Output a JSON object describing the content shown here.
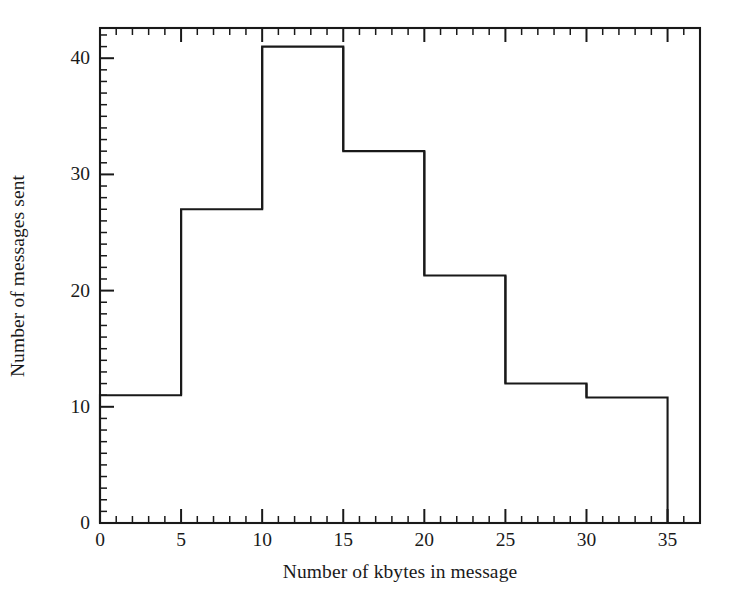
{
  "chart_data": {
    "type": "bar",
    "title": "",
    "subtitle": "",
    "xlabel": "Number of kbytes in message",
    "ylabel": "Number of messages sent",
    "bin_width": 5,
    "bin_edges": [
      0,
      5,
      10,
      15,
      20,
      25,
      30,
      35
    ],
    "categories": [
      "0-5",
      "5-10",
      "10-15",
      "15-20",
      "20-25",
      "25-30",
      "30-35"
    ],
    "values": [
      11,
      27,
      41,
      32,
      21.3,
      12,
      10.8
    ],
    "xlim": [
      0,
      37
    ],
    "ylim": [
      0,
      42.6
    ],
    "xticks": [
      0,
      5,
      10,
      15,
      20,
      25,
      30,
      35
    ],
    "xtick_labels": [
      "0",
      "5",
      "10",
      "15",
      "20",
      "25",
      "30",
      "35"
    ],
    "yticks": [
      0,
      10,
      20,
      30,
      40
    ],
    "ytick_labels": [
      "0",
      "10",
      "20",
      "30",
      "40"
    ],
    "x_minor_tick_step": 1,
    "y_minor_tick_step": 1,
    "grid": false,
    "legend": false,
    "legend_position": "none",
    "line_color": "#191919",
    "fill_color": "none",
    "background_color": "#ffffff",
    "frame": "box"
  },
  "axes": {
    "x_axis_name": "Number of kbytes in message",
    "y_axis_name": "Number of messages sent"
  }
}
